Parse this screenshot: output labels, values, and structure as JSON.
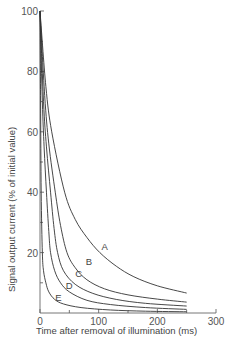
{
  "chart_data": {
    "type": "line",
    "title": "",
    "xlabel": "Time after removal of illumination (ms)",
    "ylabel": "Signal output current (% of initial value)",
    "xlim": [
      0,
      300
    ],
    "ylim": [
      0,
      100
    ],
    "x_ticks": [
      0,
      100,
      200,
      300
    ],
    "x_minor_ticks": [
      50,
      150,
      250
    ],
    "y_ticks": [
      20,
      40,
      60,
      80,
      100
    ],
    "y_minor_ticks": [
      10,
      30,
      50,
      70,
      90
    ],
    "grid": false,
    "legend": "inline curve labels",
    "series": [
      {
        "name": "A",
        "x": [
          0,
          10,
          20,
          42,
          60,
          80,
          102,
          130,
          160,
          200,
          250
        ],
        "y": [
          100,
          75,
          60,
          40,
          31,
          25,
          20,
          15.5,
          12,
          9,
          6.6
        ]
      },
      {
        "name": "B",
        "x": [
          0,
          8,
          15,
          26,
          35,
          46,
          60,
          80,
          110,
          150,
          200,
          250
        ],
        "y": [
          100,
          72,
          56,
          40,
          29,
          20,
          15,
          11,
          8,
          6,
          4.6,
          3.6
        ]
      },
      {
        "name": "C",
        "x": [
          0,
          6,
          11,
          18,
          24,
          30,
          40,
          60,
          90,
          130,
          180,
          250
        ],
        "y": [
          100,
          70,
          55,
          40,
          28,
          20,
          14,
          9.5,
          6.5,
          4.5,
          3.2,
          2.3
        ]
      },
      {
        "name": "D",
        "x": [
          0,
          4,
          7,
          11,
          15,
          18,
          25,
          35,
          50,
          80,
          120,
          180,
          250
        ],
        "y": [
          100,
          70,
          55,
          40,
          27,
          20,
          14,
          10,
          7,
          4.2,
          2.8,
          1.8,
          1.2
        ]
      },
      {
        "name": "E",
        "x": [
          0,
          1,
          2,
          4,
          6,
          10,
          15,
          25,
          40,
          70,
          120,
          180,
          250
        ],
        "y": [
          100,
          70,
          40,
          20,
          14,
          10,
          7,
          4.5,
          3,
          1.8,
          1,
          0.6,
          0.4
        ]
      }
    ],
    "curve_labels": [
      {
        "text": "A",
        "x": 105,
        "y": 21
      },
      {
        "text": "B",
        "x": 78,
        "y": 16
      },
      {
        "text": "C",
        "x": 60,
        "y": 12
      },
      {
        "text": "D",
        "x": 44,
        "y": 8
      },
      {
        "text": "E",
        "x": 26,
        "y": 4
      }
    ]
  }
}
